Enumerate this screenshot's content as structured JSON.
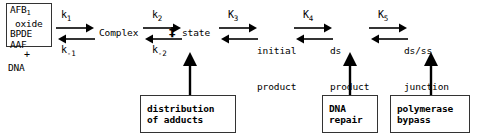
{
  "diagram": {
    "background_color": "#ffffff",
    "line_color": "#000000",
    "box_border_color": "#333333"
  },
  "reactants": {
    "line1_prefix": "AFB",
    "line1_subscript": "1",
    "line2": "oxide",
    "line3": "BPDE",
    "line4": "AAF",
    "plus": "+",
    "line5": "DNA"
  },
  "species": {
    "complex": "Complex",
    "transition_dagger": "‡",
    "transition_state": "state",
    "initial_product_line1": "initial",
    "initial_product_line2": "product",
    "ds_product_line1": "ds",
    "ds_product_line2": "product",
    "dsss_junction_line1": "ds/ss",
    "dsss_junction_line2": "junction"
  },
  "rate_constants": {
    "k1_forward": "k",
    "k1_forward_sub": "1",
    "k1_reverse": "k",
    "k1_reverse_sub": "-1",
    "k2_forward": "k",
    "k2_forward_sub": "2",
    "k2_reverse": "k",
    "k2_reverse_sub": "-2",
    "K3": "K",
    "K3_sub": "3",
    "K4": "K",
    "K4_sub": "4",
    "K5": "K",
    "K5_sub": "5"
  },
  "annotation_boxes": [
    {
      "id": "distribution-of-adducts",
      "line1": "distribution",
      "line2": "of adducts"
    },
    {
      "id": "dna-repair",
      "line1": "DNA",
      "line2": "repair"
    },
    {
      "id": "polymerase-bypass",
      "line1": "polymerase",
      "line2": "bypass"
    }
  ]
}
